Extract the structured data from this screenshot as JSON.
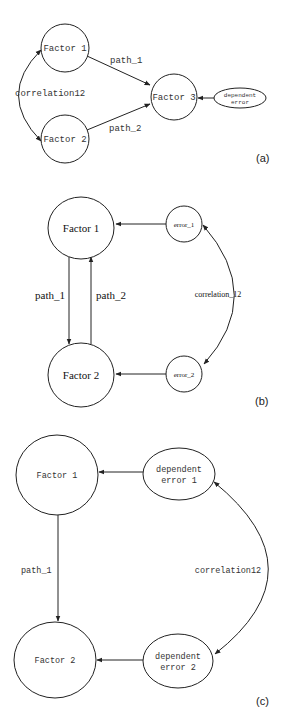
{
  "diagrams": [
    {
      "label": "(a)",
      "nodes": {
        "factor1": "Factor 1",
        "factor2": "Factor 2",
        "factor3": "Factor 3",
        "dependent_error_line1": "dependent",
        "dependent_error_line2": "error"
      },
      "edges": {
        "path_1": "path_1",
        "path_2": "path_2",
        "correlation": "correlation12"
      }
    },
    {
      "label": "(b)",
      "nodes": {
        "factor1": "Factor 1",
        "factor2": "Factor 2",
        "error1": "error_1",
        "error2": "error_2"
      },
      "edges": {
        "path_1": "path_1",
        "path_2": "path_2",
        "correlation": "correlation_12"
      }
    },
    {
      "label": "(c)",
      "nodes": {
        "factor1": "Factor 1",
        "factor2": "Factor 2",
        "dep_error1_line1": "dependent",
        "dep_error1_line2": "error 1",
        "dep_error2_line1": "dependent",
        "dep_error2_line2": "error 2"
      },
      "edges": {
        "path_1": "path_1",
        "correlation": "correlation12"
      }
    }
  ],
  "colors": {
    "stroke": "#222222",
    "background": "#ffffff"
  }
}
